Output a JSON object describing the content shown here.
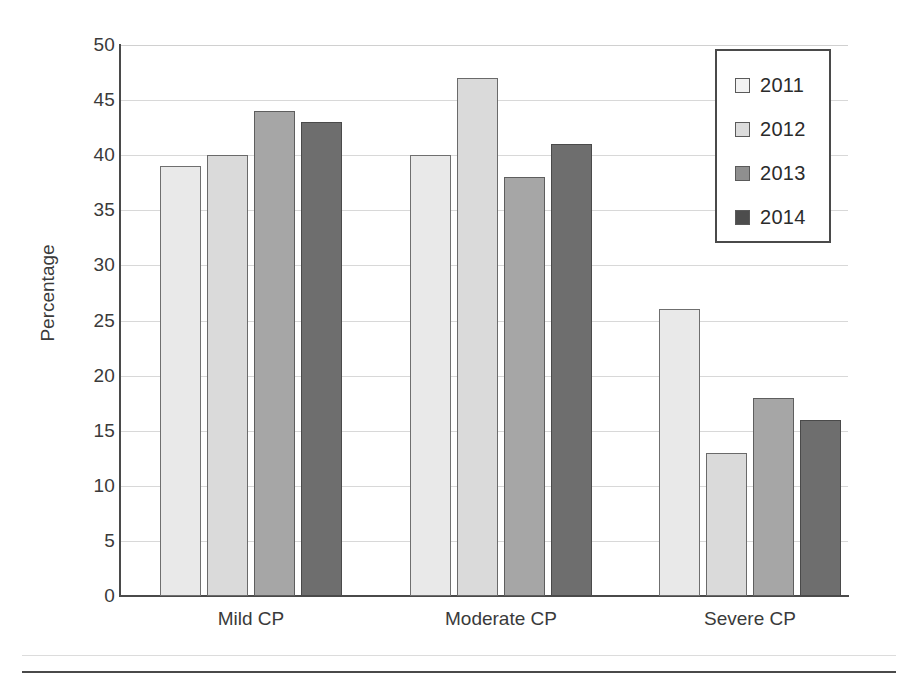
{
  "chart_data": {
    "type": "bar",
    "title": "",
    "xlabel": "",
    "ylabel": "Percentage",
    "categories": [
      "Mild CP",
      "Moderate CP",
      "Severe CP"
    ],
    "series": [
      {
        "name": "2011",
        "color": "#e9e9e9",
        "values": [
          39,
          40,
          26
        ]
      },
      {
        "name": "2012",
        "color": "#dadada",
        "values": [
          40,
          47,
          13
        ]
      },
      {
        "name": "2013",
        "color": "#a6a6a6",
        "values": [
          44,
          38,
          18
        ]
      },
      {
        "name": "2014",
        "color": "#6e6e6e",
        "values": [
          43,
          41,
          16
        ]
      }
    ],
    "ylim": [
      0,
      50
    ],
    "ytick_labels": [
      "50",
      "45",
      "40",
      "35",
      "30",
      "25",
      "20",
      "15",
      "10",
      "5",
      "0"
    ],
    "ytick_values": [
      50,
      45,
      40,
      35,
      30,
      25,
      20,
      15,
      10,
      5,
      0
    ],
    "grid": true,
    "legend_position": "top-right",
    "legend_entries": [
      "2011",
      "2012",
      "2013",
      "2014"
    ]
  }
}
